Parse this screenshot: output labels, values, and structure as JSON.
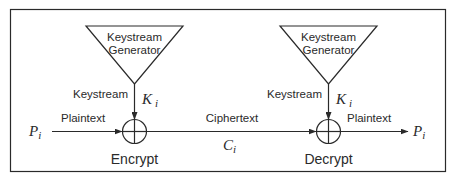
{
  "diagram": {
    "type": "stream-cipher",
    "colors": {
      "stroke": "#2a2a2a",
      "background": "#ffffff"
    },
    "encrypt": {
      "generator_line1": "Keystream",
      "generator_line2": "Generator",
      "keystream_label": "Keystream",
      "key_symbol": "K",
      "key_sub": "i",
      "input_symbol": "P",
      "input_sub": "i",
      "input_label": "Plaintext",
      "operator": "xor",
      "caption": "Encrypt"
    },
    "channel": {
      "label": "Ciphertext",
      "symbol": "C",
      "sub": "i"
    },
    "decrypt": {
      "generator_line1": "Keystream",
      "generator_line2": "Generator",
      "keystream_label": "Keystream",
      "key_symbol": "K",
      "key_sub": "i",
      "output_label": "Plaintext",
      "output_symbol": "P",
      "output_sub": "i",
      "operator": "xor",
      "caption": "Decrypt"
    }
  }
}
